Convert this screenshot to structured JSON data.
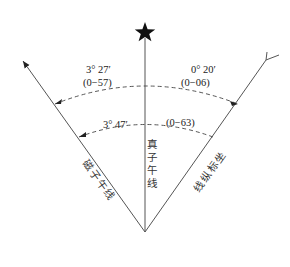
{
  "diagram": {
    "type": "north-directions-angle-diagram",
    "lines": {
      "true_meridian": {
        "label_chars": [
          "真",
          "子",
          "午",
          "线"
        ],
        "label": "真子午线",
        "end_symbol": "star"
      },
      "magnetic_meridian": {
        "label_chars": [
          "磁",
          "子",
          "午",
          "线"
        ],
        "label": "磁子午线",
        "end_symbol": "arrow"
      },
      "grid_north": {
        "label_chars": [
          "坐",
          "标",
          "纵",
          "线"
        ],
        "label": "坐标纵线",
        "end_symbol": "y-fork"
      }
    },
    "angles": {
      "declination": {
        "degrees": "3° 27′",
        "mils": "(0−57)",
        "between": "true_meridian-magnetic_meridian"
      },
      "grid_convergence": {
        "degrees": "0° 20′",
        "mils": "(0−06)",
        "between": "true_meridian-grid_north"
      },
      "grid_magnetic": {
        "degrees": "3° 47′",
        "mils": "(0−63)",
        "between": "grid_north-magnetic_meridian"
      }
    },
    "colors": {
      "line": "#555555",
      "text": "#222222",
      "star": "#111111"
    }
  }
}
